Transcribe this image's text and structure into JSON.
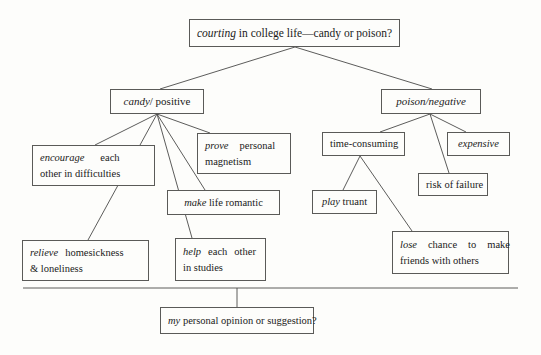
{
  "diagram": {
    "title_node": {
      "id": "root",
      "italic_lead": "courting",
      "rest": " in college life—candy or poison?",
      "full_text": "courting in college life—candy or poison?"
    },
    "branches": [
      {
        "id": "candy",
        "italic_lead": "candy",
        "rest": "/ positive",
        "full_text": "candy/ positive",
        "children": [
          {
            "id": "encourage",
            "line1_italic": "encourage",
            "line1_rest": "each",
            "line2": "other in difficulties",
            "full_text": "encourage each other in difficulties"
          },
          {
            "id": "prove",
            "line1_italic": "prove",
            "line1_rest": "personal",
            "line2": "magnetism",
            "full_text": "prove personal magnetism"
          },
          {
            "id": "make",
            "italic_lead": "make",
            "rest": " life romantic",
            "full_text": "make life romantic"
          },
          {
            "id": "relieve",
            "line1_italic": "relieve",
            "line1_rest": "homesickness",
            "line2": "& loneliness",
            "full_text": "relieve homesickness & loneliness"
          },
          {
            "id": "help",
            "line1_italic": "help",
            "line1_mid": "each",
            "line1_rest": "other",
            "line2": "in studies",
            "full_text": "help each other in studies"
          }
        ]
      },
      {
        "id": "poison",
        "italic_full": "poison/negative",
        "full_text": "poison/negative",
        "children": [
          {
            "id": "time",
            "text": "time-consuming",
            "full_text": "time-consuming"
          },
          {
            "id": "expensive",
            "italic_full": "expensive",
            "full_text": "expensive"
          },
          {
            "id": "risk",
            "text": "risk of failure",
            "full_text": "risk of failure"
          },
          {
            "id": "play",
            "italic_lead": "play",
            "rest": " truant",
            "full_text": "play truant"
          },
          {
            "id": "lose",
            "line1_italic": "lose",
            "line1_a": "chance",
            "line1_b": "to",
            "line1_c": "make",
            "line2": "friends with others",
            "full_text": "lose chance to make friends with others"
          }
        ]
      }
    ],
    "conclusion_node": {
      "id": "bottom",
      "italic_lead": "my",
      "rest": " personal opinion or suggestion?",
      "full_text": "my personal opinion or suggestion?"
    },
    "style": {
      "border_color": "#5a5a58",
      "line_color": "#4a4a48",
      "background": "#fdfdfb",
      "text_color": "#1a1a1a"
    }
  }
}
